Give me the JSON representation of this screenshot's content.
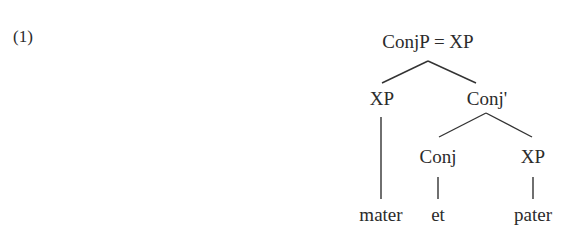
{
  "example": {
    "number": "(1)"
  },
  "tree": {
    "root": {
      "label": "ConjP = XP"
    },
    "left_xp": {
      "label": "XP",
      "leaf": "mater"
    },
    "conj_bar": {
      "label": "Conj'"
    },
    "conj": {
      "label": "Conj",
      "leaf": "et"
    },
    "right_xp": {
      "label": "XP",
      "leaf": "pater"
    }
  },
  "colors": {
    "text": "#2b2b2b",
    "lines": "#333333",
    "background": "#ffffff"
  }
}
